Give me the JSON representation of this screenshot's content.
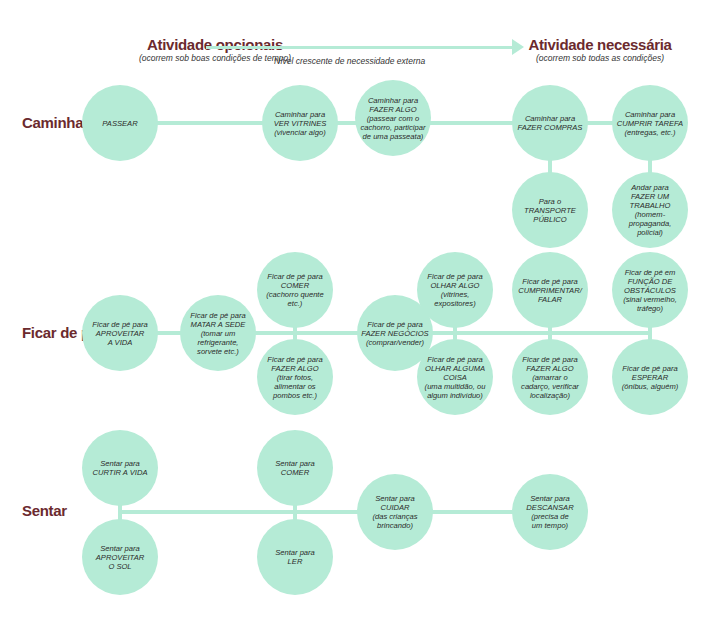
{
  "header": {
    "left_title": "Atividade opcionais",
    "left_subtitle": "(ocorrem sob boas condições de tempo)",
    "right_title": "Atividade necessária",
    "right_subtitle": "(ocorrem sob todas as condições)",
    "axis_label": "Nível crescente de necessidade externa"
  },
  "colors": {
    "node": "#b5ebd6",
    "title": "#6b2a2e"
  },
  "rows": {
    "caminhar": {
      "label": "Caminhar",
      "nodes": [
        "PASSEAR",
        "Caminhar para\nVER VITRINES\n(vivenciar algo)",
        "Caminhar para\nFAZER ALGO\n(passear com o\ncachorro, participar\nde uma passeata)",
        "Caminhar para\nFAZER COMPRAS",
        "Caminhar para\nCUMPRIR TAREFA\n(entregas, etc.)",
        "Para o\nTRANSPORTE\nPÚBLICO",
        "Andar para\nFAZER UM\nTRABALHO\n(homem-propaganda,\npolicial)"
      ]
    },
    "ficar": {
      "label": "Ficar de pé",
      "nodes": [
        "Ficar de pé para\nAPROVEITAR\nA VIDA",
        "Ficar de pé para\nMATAR A SEDE\n(tomar um\nrefrigerante,\nsorvete etc.)",
        "Ficar de pé para\nCOMER\n(cachorro quente\netc.)",
        "Ficar de pé para\nFAZER ALGO\n(tirar fotos,\nalimentar os\npombos etc.)",
        "Ficar de pé para\nFAZER NEGÓCIOS\n(comprar/vender)",
        "Ficar de pé para\nOLHAR ALGO\n(vitrines,\nexpositores)",
        "Ficar de pé para\nOLHAR ALGUMA\nCOISA\n(uma multidão, ou\nalgum indivíduo)",
        "Ficar de pé para\nCUMPRIMENTAR/\nFALAR",
        "Ficar de pé para\nFAZER ALGO\n(amarrar o\ncadarço, verificar\nlocalização)",
        "Ficar de pé em\nFUNÇÃO DE\nOBSTÁCULOS\n(sinal vermelho,\ntráfego)",
        "Ficar de pé para\nESPERAR\n(ônibus, alguém)"
      ]
    },
    "sentar": {
      "label": "Sentar",
      "nodes": [
        "Sentar para\nCURTIR A VIDA",
        "Sentar para\nAPROVEITAR\nO SOL",
        "Sentar para\nCOMER",
        "Sentar para\nLER",
        "Sentar para\nCUIDAR\n(das crianças\nbrincando)",
        "Sentar para\nDESCANSAR\n(precisa de\num tempo)"
      ]
    }
  }
}
